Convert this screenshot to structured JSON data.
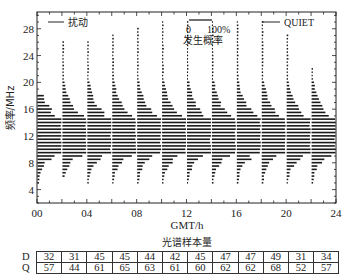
{
  "chart_data": {
    "type": "bar",
    "subtype": "horizontal-probability-histograms-per-time-bin",
    "title": "",
    "xlabel": "GMT/h",
    "ylabel": "频率/MHz",
    "xlim": [
      0,
      24
    ],
    "ylim": [
      2,
      30.5
    ],
    "x_ticks": [
      "00",
      "04",
      "08",
      "12",
      "16",
      "20",
      "24"
    ],
    "x_tick_values": [
      0,
      4,
      8,
      12,
      16,
      20,
      24
    ],
    "y_ticks": [
      4,
      8,
      12,
      16,
      20,
      24,
      28
    ],
    "grid": false,
    "legend": [
      {
        "name": "扰动",
        "style": "line",
        "position": "top-left"
      },
      {
        "name": "QUIET",
        "style": "line",
        "position": "top-right"
      }
    ],
    "scale_bar": {
      "label_start": "0",
      "label_end": "100%",
      "caption": "发生概率"
    },
    "time_bins": [
      "00-02",
      "02-04",
      "04-06",
      "06-08",
      "08-10",
      "10-12",
      "12-14",
      "14-16",
      "16-18",
      "18-20",
      "20-22",
      "22-24"
    ],
    "bin_bar_tops_MHz": [
      18,
      26,
      26,
      27,
      28,
      29,
      29,
      29,
      29,
      29,
      27,
      22
    ],
    "bin_bar_bottoms_MHz": [
      5,
      6,
      5,
      5,
      5,
      5,
      5,
      5,
      5,
      5,
      5,
      5
    ],
    "profile_center_MHz": 12,
    "sample_count_table": {
      "title": "光谱样本量",
      "rows": [
        {
          "label": "D",
          "values": [
            32,
            31,
            45,
            45,
            44,
            42,
            45,
            47,
            47,
            49,
            31,
            34
          ]
        },
        {
          "label": "Q",
          "values": [
            57,
            44,
            61,
            65,
            63,
            61,
            60,
            62,
            62,
            68,
            52,
            57
          ]
        }
      ]
    }
  },
  "labels": {
    "legend_disturbed": "扰动",
    "legend_quiet": "QUIET",
    "scale_zero": "0",
    "scale_full": "100%",
    "scale_caption": "发生概率",
    "xlabel": "GMT/h",
    "ylabel": "频率/MHz",
    "table_title": "光谱样本量",
    "row_d": "D",
    "row_q": "Q"
  }
}
